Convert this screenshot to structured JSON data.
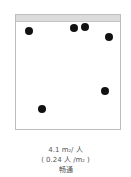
{
  "diagram": {
    "dots": [
      {
        "x": 29,
        "y": 31
      },
      {
        "x": 74,
        "y": 28
      },
      {
        "x": 85,
        "y": 27
      },
      {
        "x": 109,
        "y": 37
      },
      {
        "x": 105,
        "y": 91
      },
      {
        "x": 42,
        "y": 109
      }
    ],
    "caption": {
      "line1_value": "4.1 m",
      "line1_sup": "2",
      "line1_unit": "/ 人",
      "line2_prefix": "( 0.24 人 /m",
      "line2_sup": "2",
      "line2_suffix": " )",
      "line3": "畅通"
    }
  }
}
